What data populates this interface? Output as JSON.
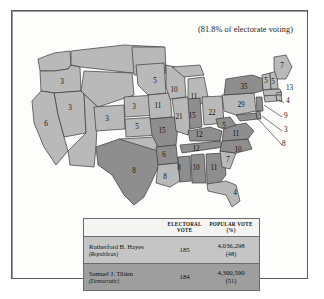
{
  "caption": {
    "turnout": "(81.8% of electorate voting)"
  },
  "legend": {
    "republican_color": "#b9b9b9",
    "democratic_color": "#8e8e8e"
  },
  "map": {
    "title": "1876 United States presidential election electoral map",
    "states": [
      {
        "name": "Oregon",
        "abbr": "OR",
        "votes": "3",
        "party": "rep",
        "x": 38,
        "y": 47
      },
      {
        "name": "Nevada",
        "abbr": "NV",
        "votes": "3",
        "party": "rep",
        "x": 46,
        "y": 73
      },
      {
        "name": "California",
        "abbr": "CA",
        "votes": "6",
        "party": "rep",
        "x": 22,
        "y": 89
      },
      {
        "name": "Colorado",
        "abbr": "CO",
        "votes": "3",
        "party": "rep",
        "x": 83,
        "y": 84
      },
      {
        "name": "Nebraska",
        "abbr": "NE",
        "votes": "3",
        "party": "rep",
        "x": 110,
        "y": 72
      },
      {
        "name": "Kansas",
        "abbr": "KS",
        "votes": "5",
        "party": "rep",
        "x": 113,
        "y": 92
      },
      {
        "name": "Texas",
        "abbr": "TX",
        "votes": "8",
        "party": "dem",
        "x": 110,
        "y": 136
      },
      {
        "name": "Minnesota",
        "abbr": "MN",
        "votes": "5",
        "party": "rep",
        "x": 131,
        "y": 46
      },
      {
        "name": "Iowa",
        "abbr": "IA",
        "votes": "11",
        "party": "rep",
        "x": 134,
        "y": 71
      },
      {
        "name": "Missouri",
        "abbr": "MO",
        "votes": "15",
        "party": "dem",
        "x": 138,
        "y": 96
      },
      {
        "name": "Arkansas",
        "abbr": "AR",
        "votes": "6",
        "party": "dem",
        "x": 140,
        "y": 120
      },
      {
        "name": "Louisiana",
        "abbr": "LA",
        "votes": "8",
        "party": "rep",
        "x": 141,
        "y": 142
      },
      {
        "name": "Wisconsin",
        "abbr": "WI",
        "votes": "10",
        "party": "rep",
        "x": 150,
        "y": 55
      },
      {
        "name": "Illinois",
        "abbr": "IL",
        "votes": "21",
        "party": "rep",
        "x": 155,
        "y": 82
      },
      {
        "name": "Mississippi",
        "abbr": "MS",
        "votes": "8",
        "party": "dem",
        "x": 155,
        "y": 133
      },
      {
        "name": "Michigan",
        "abbr": "MI",
        "votes": "11",
        "party": "rep",
        "x": 170,
        "y": 62
      },
      {
        "name": "Indiana",
        "abbr": "IN",
        "votes": "15",
        "party": "dem",
        "x": 168,
        "y": 81
      },
      {
        "name": "Kentucky",
        "abbr": "KY",
        "votes": "12",
        "party": "dem",
        "x": 175,
        "y": 100
      },
      {
        "name": "Tennessee",
        "abbr": "TN",
        "votes": "12",
        "party": "dem",
        "x": 172,
        "y": 114
      },
      {
        "name": "Alabama",
        "abbr": "AL",
        "votes": "10",
        "party": "dem",
        "x": 172,
        "y": 133
      },
      {
        "name": "Ohio",
        "abbr": "OH",
        "votes": "22",
        "party": "rep",
        "x": 188,
        "y": 78
      },
      {
        "name": "Georgia",
        "abbr": "GA",
        "votes": "11",
        "party": "dem",
        "x": 190,
        "y": 133
      },
      {
        "name": "West Virginia",
        "abbr": "WV",
        "votes": "5",
        "party": "dem",
        "x": 200,
        "y": 91
      },
      {
        "name": "Virginia",
        "abbr": "VA",
        "votes": "11",
        "party": "dem",
        "x": 210,
        "y": 99
      },
      {
        "name": "North Carolina",
        "abbr": "NC",
        "votes": "10",
        "party": "dem",
        "x": 212,
        "y": 115
      },
      {
        "name": "South Carolina",
        "abbr": "SC",
        "votes": "7",
        "party": "rep",
        "x": 204,
        "y": 125
      },
      {
        "name": "Florida",
        "abbr": "FL",
        "votes": "4",
        "party": "rep",
        "x": 211,
        "y": 158
      },
      {
        "name": "Pennsylvania",
        "abbr": "PA",
        "votes": "29",
        "party": "rep",
        "x": 217,
        "y": 73
      },
      {
        "name": "New York",
        "abbr": "NY",
        "votes": "35",
        "party": "dem",
        "x": 223,
        "y": 57
      },
      {
        "name": "Maine",
        "abbr": "ME",
        "votes": "7",
        "party": "rep",
        "x": 251,
        "y": 35
      },
      {
        "name": "Vermont",
        "abbr": "VT",
        "votes": "5",
        "party": "rep",
        "x": 241,
        "y": 48
      },
      {
        "name": "New Hampshire",
        "abbr": "NH",
        "votes": "5",
        "party": "rep",
        "x": 247,
        "y": 53
      }
    ],
    "callouts": [
      {
        "name": "Massachusetts",
        "abbr": "MA",
        "votes": "13",
        "party": "rep",
        "x": 262,
        "y": 53
      },
      {
        "name": "Rhode Island",
        "abbr": "RI",
        "votes": "4",
        "party": "rep",
        "x": 264,
        "y": 65
      },
      {
        "name": "New Jersey",
        "abbr": "NJ",
        "votes": "9",
        "party": "dem",
        "x": 262,
        "y": 80
      },
      {
        "name": "Delaware",
        "abbr": "DE",
        "votes": "3",
        "party": "dem",
        "x": 262,
        "y": 94
      },
      {
        "name": "Maryland",
        "abbr": "MD",
        "votes": "8",
        "party": "dem",
        "x": 262,
        "y": 108
      }
    ]
  },
  "results_table": {
    "headers": {
      "candidate": "",
      "electoral_line1": "ELECTORAL",
      "electoral_line2": "VOTE",
      "popular_line1": "POPULAR VOTE",
      "popular_line2": "(%)"
    },
    "rows": [
      {
        "candidate": "Rutherford B. Hayes",
        "party": "(Republican)",
        "electoral_vote": "185",
        "popular_vote": "4,036,298",
        "popular_pct": "(48)"
      },
      {
        "candidate": "Samuel J. Tilden",
        "party": "(Democratic)",
        "electoral_vote": "184",
        "popular_vote": "4,300,590",
        "popular_pct": "(51)"
      }
    ]
  }
}
